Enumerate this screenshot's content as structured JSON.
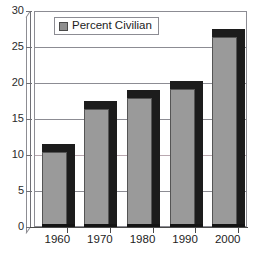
{
  "chart_data": {
    "type": "bar",
    "title": "",
    "subtitle": "",
    "xlabel": "",
    "ylabel": "",
    "categories": [
      "1960",
      "1970",
      "1980",
      "1990",
      "2000"
    ],
    "series": [
      {
        "name": "Percent Civilian",
        "values": [
          10.5,
          16.5,
          18.0,
          19.3,
          26.5
        ],
        "color": "#9a9a9a"
      }
    ],
    "ylim": [
      0,
      30
    ],
    "ytick_labels": [
      "0",
      "5",
      "10",
      "15",
      "20",
      "25",
      "30"
    ],
    "ytick_values": [
      0,
      5,
      10,
      15,
      20,
      25,
      30
    ],
    "grid": true,
    "grid_axis": "y",
    "legend": {
      "position": "top-left-inside",
      "entries": [
        {
          "label": "Percent Civilian",
          "swatch_color": "#8f8f8f"
        }
      ]
    },
    "style": {
      "three_d": true,
      "background": "#ffffff",
      "bar_face_color": "#9a9a9a",
      "bar_shadow_color": "#1c1c1c",
      "bar_edge_color": "#555555",
      "gridline_color": "#8c8c93",
      "axis_color": "#4a4a4a",
      "text_color": "#1d1d1d"
    }
  }
}
